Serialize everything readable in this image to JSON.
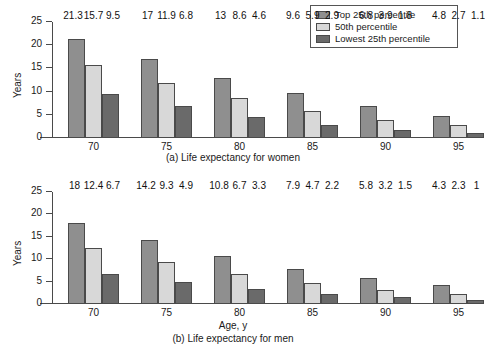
{
  "legend": {
    "position": "top-right",
    "items": [
      {
        "label": "Top 25th percentile",
        "color": "#8f8f8f",
        "key": "top25"
      },
      {
        "label": "50th percentile",
        "color": "#d8d8d8",
        "key": "p50"
      },
      {
        "label": "Lowest 25th percentile",
        "color": "#6a6a6a",
        "key": "low25"
      }
    ]
  },
  "chart_data": [
    {
      "type": "bar",
      "id": "women",
      "title": "(a) Life expectancy for women",
      "xlabel": "",
      "ylabel": "Years",
      "ylim": [
        0,
        25
      ],
      "yticks": [
        0,
        5,
        10,
        15,
        20,
        25
      ],
      "grid": false,
      "categories": [
        "70",
        "75",
        "80",
        "85",
        "90",
        "95"
      ],
      "series": [
        {
          "name": "Top 25th percentile",
          "color": "#8f8f8f",
          "values": [
            21.3,
            17,
            13,
            9.6,
            6.8,
            4.8
          ]
        },
        {
          "name": "50th percentile",
          "color": "#d8d8d8",
          "values": [
            15.7,
            11.9,
            8.6,
            5.9,
            3.9,
            2.7
          ]
        },
        {
          "name": "Lowest 25th percentile",
          "color": "#6a6a6a",
          "values": [
            9.5,
            6.8,
            4.6,
            2.9,
            1.8,
            1.1
          ]
        }
      ],
      "labels": [
        [
          "21.3",
          "15.7",
          "9.5"
        ],
        [
          "17",
          "11.9",
          "6.8"
        ],
        [
          "13",
          "8.6",
          "4.6"
        ],
        [
          "9.6",
          "5.9",
          "2.9"
        ],
        [
          "6.8",
          "3.9",
          "1.8"
        ],
        [
          "4.8",
          "2.7",
          "1.1"
        ]
      ]
    },
    {
      "type": "bar",
      "id": "men",
      "title": "(b) Life expectancy for men",
      "xlabel": "Age, y",
      "ylabel": "Years",
      "ylim": [
        0,
        25
      ],
      "yticks": [
        0,
        5,
        10,
        15,
        20,
        25
      ],
      "grid": false,
      "categories": [
        "70",
        "75",
        "80",
        "85",
        "90",
        "95"
      ],
      "series": [
        {
          "name": "Top 25th percentile",
          "color": "#8f8f8f",
          "values": [
            18,
            14.2,
            10.8,
            7.9,
            5.8,
            4.3
          ]
        },
        {
          "name": "50th percentile",
          "color": "#d8d8d8",
          "values": [
            12.4,
            9.3,
            6.7,
            4.7,
            3.2,
            2.3
          ]
        },
        {
          "name": "Lowest 25th percentile",
          "color": "#6a6a6a",
          "values": [
            6.7,
            4.9,
            3.3,
            2.2,
            1.5,
            1
          ]
        }
      ],
      "labels": [
        [
          "18",
          "12.4",
          "6.7"
        ],
        [
          "14.2",
          "9.3",
          "4.9"
        ],
        [
          "10.8",
          "6.7",
          "3.3"
        ],
        [
          "7.9",
          "4.7",
          "2.2"
        ],
        [
          "5.8",
          "3.2",
          "1.5"
        ],
        [
          "4.3",
          "2.3",
          "1"
        ]
      ]
    }
  ]
}
